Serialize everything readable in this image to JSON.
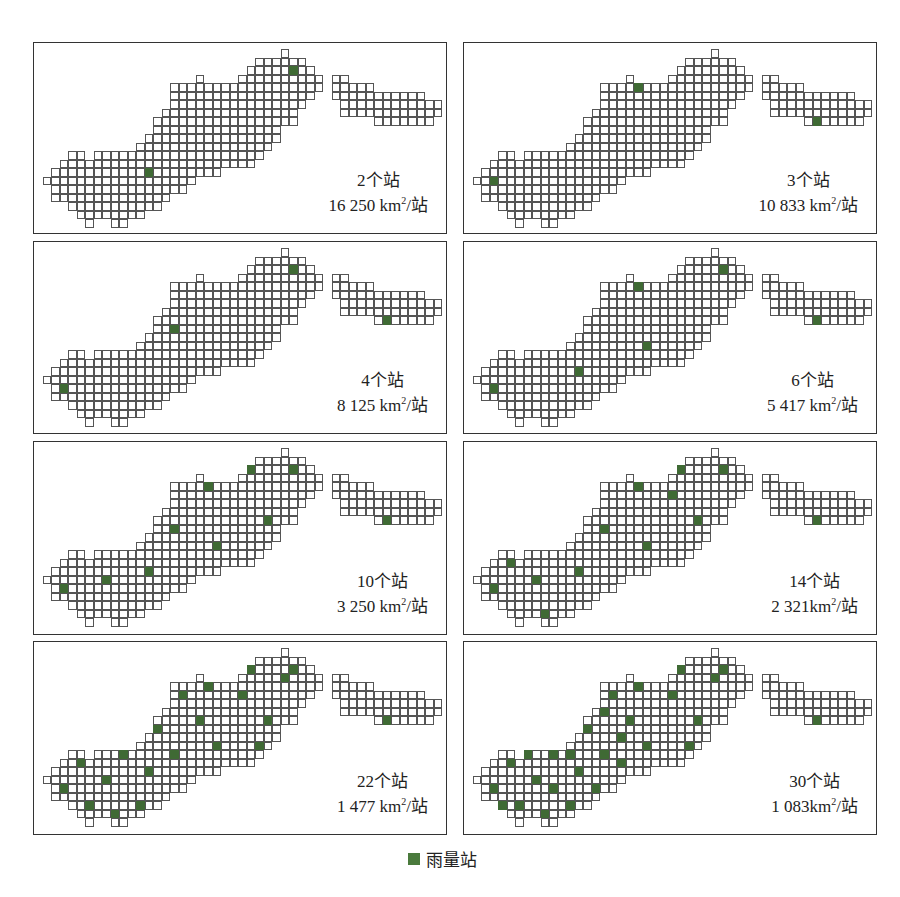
{
  "grid": {
    "cell_size": 8.5,
    "origin_offset": [
      8.7,
      6.3
    ],
    "rows": [
      [
        [
          28,
          28
        ]
      ],
      [
        [
          25,
          30
        ]
      ],
      [
        [
          24,
          31
        ]
      ],
      [
        [
          18,
          18
        ],
        [
          23,
          32
        ],
        [
          34,
          35
        ]
      ],
      [
        [
          15,
          32
        ],
        [
          34,
          38
        ]
      ],
      [
        [
          15,
          31
        ],
        [
          34,
          44
        ]
      ],
      [
        [
          15,
          30
        ],
        [
          35,
          46
        ]
      ],
      [
        [
          14,
          29
        ],
        [
          35,
          46
        ]
      ],
      [
        [
          13,
          29
        ],
        [
          39,
          45
        ]
      ],
      [
        [
          13,
          27
        ]
      ],
      [
        [
          12,
          27
        ]
      ],
      [
        [
          11,
          26
        ]
      ],
      [
        [
          3,
          4
        ],
        [
          6,
          25
        ]
      ],
      [
        [
          2,
          24
        ]
      ],
      [
        [
          1,
          20
        ]
      ],
      [
        [
          0,
          17
        ]
      ],
      [
        [
          1,
          16
        ]
      ],
      [
        [
          1,
          14
        ]
      ],
      [
        [
          3,
          13
        ]
      ],
      [
        [
          4,
          11
        ]
      ],
      [
        [
          5,
          5
        ],
        [
          8,
          9
        ]
      ]
    ]
  },
  "panels": [
    {
      "count_label": "2个站",
      "density_value": "16 250 km",
      "density_suffix": "/站",
      "stations": [
        [
          29,
          2
        ],
        [
          12,
          14
        ]
      ]
    },
    {
      "count_label": "3个站",
      "density_value": "10 833 km",
      "density_suffix": "/站",
      "stations": [
        [
          19,
          4
        ],
        [
          40,
          8
        ],
        [
          2,
          15
        ]
      ]
    },
    {
      "count_label": "4个站",
      "density_value": "8 125 km",
      "density_suffix": "/站",
      "stations": [
        [
          29,
          2
        ],
        [
          15,
          9
        ],
        [
          40,
          8
        ],
        [
          2,
          16
        ]
      ]
    },
    {
      "count_label": "6个站",
      "density_value": "5 417 km",
      "density_suffix": "/站",
      "stations": [
        [
          29,
          2
        ],
        [
          19,
          4
        ],
        [
          40,
          8
        ],
        [
          20,
          11
        ],
        [
          12,
          14
        ],
        [
          2,
          16
        ]
      ]
    },
    {
      "count_label": "10个站",
      "density_value": "3 250 km",
      "density_suffix": "/站",
      "stations": [
        [
          24,
          2
        ],
        [
          29,
          2
        ],
        [
          19,
          4
        ],
        [
          26,
          8
        ],
        [
          40,
          8
        ],
        [
          15,
          9
        ],
        [
          20,
          11
        ],
        [
          12,
          14
        ],
        [
          7,
          15
        ],
        [
          2,
          16
        ]
      ]
    },
    {
      "count_label": "14个站",
      "density_value": "2 321km",
      "density_suffix": "/站",
      "stations": [
        [
          24,
          2
        ],
        [
          29,
          2
        ],
        [
          19,
          4
        ],
        [
          23,
          5
        ],
        [
          26,
          8
        ],
        [
          40,
          8
        ],
        [
          15,
          9
        ],
        [
          20,
          11
        ],
        [
          4,
          13
        ],
        [
          12,
          14
        ],
        [
          7,
          15
        ],
        [
          18,
          15
        ],
        [
          2,
          16
        ],
        [
          8,
          19
        ]
      ]
    },
    {
      "count_label": "22个站",
      "density_value": "1 477 km",
      "density_suffix": "/站",
      "stations": [
        [
          24,
          2
        ],
        [
          29,
          2
        ],
        [
          28,
          3
        ],
        [
          19,
          4
        ],
        [
          16,
          5
        ],
        [
          23,
          5
        ],
        [
          18,
          8
        ],
        [
          26,
          8
        ],
        [
          40,
          8
        ],
        [
          13,
          9
        ],
        [
          20,
          11
        ],
        [
          25,
          11
        ],
        [
          9,
          12
        ],
        [
          15,
          12
        ],
        [
          4,
          13
        ],
        [
          12,
          14
        ],
        [
          7,
          15
        ],
        [
          18,
          15
        ],
        [
          2,
          16
        ],
        [
          5,
          18
        ],
        [
          11,
          18
        ],
        [
          8,
          19
        ]
      ]
    },
    {
      "count_label": "30个站",
      "density_value": "1 083km",
      "density_suffix": "/站",
      "stations": [
        [
          24,
          2
        ],
        [
          29,
          2
        ],
        [
          28,
          3
        ],
        [
          19,
          4
        ],
        [
          16,
          5
        ],
        [
          23,
          5
        ],
        [
          15,
          7
        ],
        [
          18,
          8
        ],
        [
          26,
          8
        ],
        [
          40,
          8
        ],
        [
          13,
          9
        ],
        [
          17,
          10
        ],
        [
          20,
          11
        ],
        [
          25,
          11
        ],
        [
          6,
          12
        ],
        [
          9,
          12
        ],
        [
          11,
          12
        ],
        [
          15,
          12
        ],
        [
          4,
          13
        ],
        [
          17,
          13
        ],
        [
          12,
          14
        ],
        [
          7,
          15
        ],
        [
          18,
          15
        ],
        [
          2,
          16
        ],
        [
          9,
          16
        ],
        [
          14,
          16
        ],
        [
          3,
          18
        ],
        [
          5,
          18
        ],
        [
          11,
          18
        ],
        [
          8,
          19
        ]
      ]
    }
  ],
  "legend": {
    "label": "雨量站",
    "color": "#4a7a3c"
  },
  "colors": {
    "station": "#3f6a34",
    "cell_border": "#555555",
    "frame": "#333333"
  }
}
